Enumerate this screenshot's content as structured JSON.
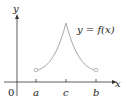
{
  "diagram": {
    "type": "function-graph",
    "axes": {
      "x_label": "x",
      "y_label": "y",
      "origin_label": "0"
    },
    "ticks": [
      {
        "label": "a",
        "x": 36
      },
      {
        "label": "c",
        "x": 66
      },
      {
        "label": "b",
        "x": 96
      }
    ],
    "curve_label": "y = f(x)",
    "curve_color": "#a8a8a8",
    "features": {
      "cusp_at": "c",
      "open_endpoints": [
        "a",
        "b"
      ]
    }
  }
}
